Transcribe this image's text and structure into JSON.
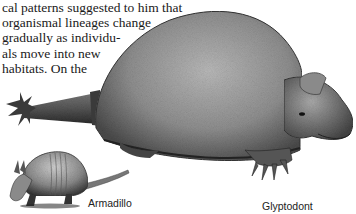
{
  "body_text": {
    "lines": [
      "cal patterns suggested to him that",
      "organismal lineages change",
      "gradually as individu-",
      "als move into new",
      "habitats.  On  the"
    ]
  },
  "figure": {
    "captions": {
      "armadillo": "Armadillo",
      "glyptodont": "Glyptodont"
    }
  }
}
